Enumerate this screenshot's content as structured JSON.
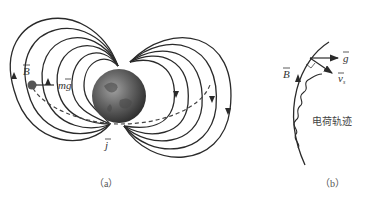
{
  "figure_a": {
    "caption": "（a）",
    "labels": {
      "B": "B",
      "mg": "mg",
      "j": "j"
    }
  },
  "figure_b": {
    "caption": "（b）",
    "labels": {
      "B": "B",
      "g": "g",
      "v": "v",
      "v_sub": "s",
      "trajectory": "电荷轨迹"
    }
  },
  "colors": {
    "line": "#2a2a2a",
    "earth_dark": "#3a3a3a",
    "earth_light": "#8a8a8a",
    "particle": "#555555"
  }
}
